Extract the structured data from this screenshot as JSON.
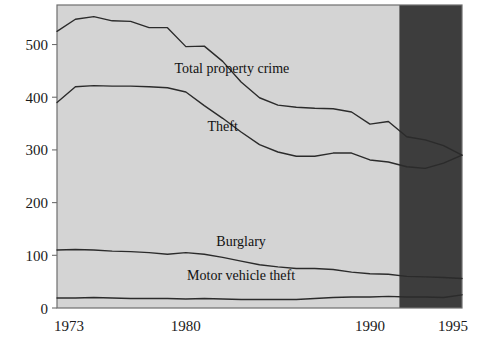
{
  "chart_data": {
    "type": "line",
    "title": "",
    "subtitle": "",
    "xlabel": "",
    "ylabel": "",
    "xlim": [
      1973,
      1995
    ],
    "ylim": [
      0,
      575
    ],
    "grid": false,
    "legend_position": "inline-annotations",
    "yticks": [
      0,
      100,
      200,
      300,
      400,
      500
    ],
    "ytick_labels": [
      "0",
      "100",
      "200",
      "300",
      "400",
      "500"
    ],
    "xticks": [
      1973,
      1980,
      1990,
      1995
    ],
    "xtick_labels": [
      "1973",
      "1980",
      "1990",
      "1995"
    ],
    "x": [
      1973,
      1974,
      1975,
      1976,
      1977,
      1978,
      1979,
      1980,
      1981,
      1982,
      1983,
      1984,
      1985,
      1986,
      1987,
      1988,
      1989,
      1990,
      1991,
      1992,
      1993,
      1994,
      1995
    ],
    "series": [
      {
        "name": "Total property crime",
        "values": [
          525,
          548,
          553,
          545,
          544,
          532,
          532,
          496,
          497,
          468,
          429,
          399,
          385,
          381,
          379,
          378,
          372,
          349,
          354,
          325,
          319,
          308,
          290
        ],
        "label_text": "Total property crime",
        "label_x": 1982.5,
        "label_y": 455
      },
      {
        "name": "Theft",
        "values": [
          390,
          420,
          422,
          421,
          421,
          420,
          418,
          410,
          384,
          360,
          334,
          310,
          296,
          288,
          288,
          294,
          294,
          281,
          277,
          268,
          265,
          275,
          290
        ],
        "label_text": "Theft",
        "label_x": 1982.0,
        "label_y": 345
      },
      {
        "name": "Burglary",
        "values": [
          110,
          111,
          110,
          108,
          107,
          105,
          102,
          105,
          102,
          96,
          89,
          82,
          78,
          75,
          75,
          73,
          68,
          65,
          64,
          60,
          59,
          58,
          56
        ],
        "label_text": "Burglary",
        "label_x": 1983.0,
        "label_y": 128
      },
      {
        "name": "Motor vehicle theft",
        "values": [
          19,
          19,
          20,
          19,
          18,
          18,
          18,
          17,
          18,
          17,
          16,
          16,
          16,
          16,
          18,
          20,
          21,
          21,
          22,
          21,
          21,
          20,
          25
        ],
        "label_text": "Motor vehicle theft",
        "label_x": 1983.0,
        "label_y": 63
      }
    ],
    "annotations": [
      {
        "name": "shaded-projection-band",
        "x_start": 1991.6,
        "x_end": 1995,
        "note": ""
      }
    ]
  },
  "style": {
    "plot_fill": "#d4d4d4",
    "band_fill": "#3d3d3d",
    "line_color": "#2b2b2b",
    "border_color": "#6e6e6e",
    "text_color": "#1a1a1a",
    "background": "#ffffff"
  }
}
